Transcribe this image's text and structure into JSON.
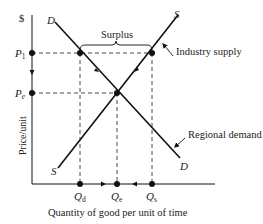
{
  "diagram": {
    "title": "",
    "y_axis": {
      "unit_label": "$",
      "label": "Price/unit"
    },
    "x_axis": {
      "label": "Quantity of good per unit of time"
    },
    "price_levels": {
      "p1": {
        "main": "P",
        "sub": "1"
      },
      "pe": {
        "main": "P",
        "sub": "e"
      }
    },
    "quantity_levels": {
      "qd": {
        "main": "Q",
        "sub": "d"
      },
      "qe": {
        "main": "Q",
        "sub": "e"
      },
      "qs": {
        "main": "Q",
        "sub": "s"
      }
    },
    "curves": {
      "demand": {
        "end_label_top": "D",
        "end_label_bottom": "D",
        "callout": "Regional demand"
      },
      "supply": {
        "end_label_top": "S",
        "end_label_bottom": "S",
        "callout": "Industry supply"
      }
    },
    "annotations": {
      "surplus": "Surplus"
    },
    "colors": {
      "line": "#111111",
      "text": "#222222",
      "background": "#ffffff"
    }
  }
}
